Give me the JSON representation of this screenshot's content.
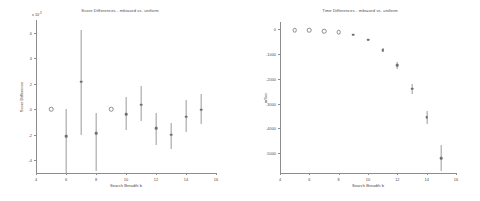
{
  "figure": {
    "background": "#ffffff",
    "marker_color": "#6f6f6f",
    "axis_color": "#8d8d8d",
    "text_color": "#4a4a4a"
  },
  "chart_data": [
    {
      "type": "scatter",
      "panel": "left",
      "title": "Score Differences - mbiased vs. uniform",
      "xlabel": "Search Breadth b",
      "ylabel": "Score Difference",
      "y_exponent_label": "x 10",
      "y_exponent_value": "-3",
      "xlim": [
        4,
        16
      ],
      "ylim": [
        -5,
        7
      ],
      "xticks": [
        4,
        6,
        8,
        10,
        12,
        14,
        16
      ],
      "yticks": [
        -4,
        -2,
        0,
        2,
        4,
        6
      ],
      "xticklabels": [
        "4",
        "6",
        "8",
        "10",
        "12",
        "14",
        "16"
      ],
      "yticklabels": [
        "-4",
        "-2",
        "0",
        "2",
        "4",
        "6"
      ],
      "grid": false,
      "legend": "none",
      "x": [
        5,
        6,
        7,
        8,
        9,
        10,
        11,
        12,
        13,
        14,
        15
      ],
      "values": [
        0.0,
        -2.1,
        2.15,
        -1.9,
        0.02,
        -0.4,
        0.35,
        -1.5,
        -2.0,
        -0.6,
        -0.05
      ],
      "yerr_low": [
        0.05,
        2.95,
        4.15,
        2.95,
        0.03,
        1.2,
        1.3,
        1.3,
        1.1,
        1.2,
        1.1
      ],
      "yerr_high": [
        0.05,
        2.15,
        4.05,
        1.6,
        0.03,
        1.4,
        1.5,
        1.2,
        0.95,
        1.35,
        1.25
      ],
      "marker_style": [
        "hollow",
        "filled",
        "filled",
        "filled",
        "hollow",
        "filled",
        "filled",
        "filled",
        "filled",
        "filled",
        "filled"
      ]
    },
    {
      "type": "scatter",
      "panel": "right",
      "title": "Time Differences - mbiased vs. uniform",
      "xlabel": "Search Breadth b",
      "ylabel": "mSec",
      "xlim": [
        4,
        16
      ],
      "ylim": [
        -5800,
        300
      ],
      "xticks": [
        4,
        6,
        8,
        10,
        12,
        14,
        16
      ],
      "yticks": [
        0,
        -1000,
        -2000,
        -3000,
        -4000,
        -5000
      ],
      "xticklabels": [
        "4",
        "6",
        "8",
        "10",
        "12",
        "14",
        "16"
      ],
      "yticklabels": [
        "0",
        "-1000",
        "-2000",
        "-3000",
        "-4000",
        "-5000"
      ],
      "grid": false,
      "legend": "none",
      "x": [
        5,
        6,
        7,
        8,
        9,
        10,
        11,
        12,
        13,
        14,
        15
      ],
      "values": [
        -20,
        -30,
        -60,
        -110,
        -210,
        -420,
        -840,
        -1450,
        -2400,
        -3550,
        -5200
      ],
      "yerr_low": [
        10,
        12,
        15,
        20,
        30,
        45,
        70,
        150,
        190,
        260,
        520
      ],
      "yerr_high": [
        10,
        12,
        15,
        20,
        30,
        45,
        70,
        150,
        190,
        260,
        520
      ],
      "marker_style": [
        "hollow",
        "hollow",
        "hollow",
        "hollow",
        "filled",
        "filled",
        "filled",
        "filled",
        "filled",
        "filled",
        "filled"
      ]
    }
  ]
}
